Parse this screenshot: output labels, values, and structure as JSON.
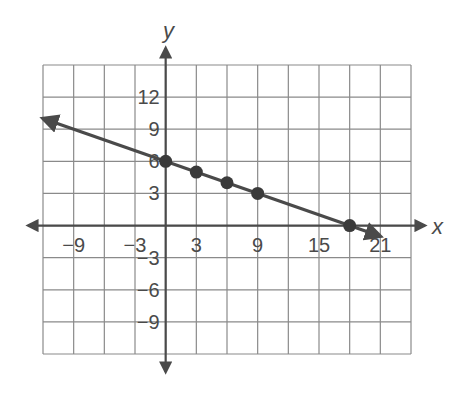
{
  "chart_data": {
    "type": "line",
    "title": "",
    "xlabel": "x",
    "ylabel": "y",
    "xlim": [
      -12,
      24
    ],
    "ylim": [
      -12,
      15
    ],
    "grid": true,
    "grid_step": 3,
    "x_tick_labels": [
      "-9",
      "-3",
      "3",
      "9",
      "15",
      "21"
    ],
    "x_tick_values": [
      -9,
      -3,
      3,
      9,
      15,
      21
    ],
    "y_tick_labels": [
      "12",
      "9",
      "6",
      "3",
      "-3",
      "-6",
      "-9"
    ],
    "y_tick_values": [
      12,
      9,
      6,
      3,
      -3,
      -6,
      -9
    ],
    "series": [
      {
        "name": "line",
        "equation": "y = -x/3 + 6",
        "slope": -0.3333,
        "intercept": 6,
        "points": [
          {
            "x": 0,
            "y": 6
          },
          {
            "x": 3,
            "y": 5
          },
          {
            "x": 6,
            "y": 4
          },
          {
            "x": 9,
            "y": 3
          },
          {
            "x": 18,
            "y": 0
          }
        ],
        "extends_from": {
          "x": -12,
          "y": 10
        },
        "extends_to": {
          "x": 21,
          "y": -1
        }
      }
    ],
    "legend": null
  },
  "colors": {
    "grid": "#8a8a8a",
    "axis": "#4a4a4a",
    "line": "#4a4a4a",
    "points": "#3a3a3a",
    "text": "#4a4a4a"
  }
}
